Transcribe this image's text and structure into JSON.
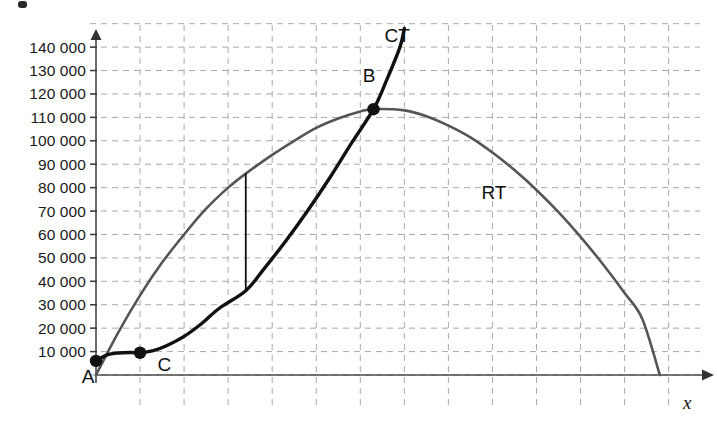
{
  "chart_data": {
    "type": "line",
    "title": "",
    "xlabel": "x",
    "ylabel": "",
    "grid": true,
    "legend_position": "inline-curve-labels",
    "xlim": [
      0,
      12.8
    ],
    "ylim": [
      0,
      150000
    ],
    "y_ticks": [
      {
        "value": 10000,
        "label": "10 000"
      },
      {
        "value": 20000,
        "label": "20 000"
      },
      {
        "value": 30000,
        "label": "30 000"
      },
      {
        "value": 40000,
        "label": "40 000"
      },
      {
        "value": 50000,
        "label": "50 000"
      },
      {
        "value": 60000,
        "label": "60 000"
      },
      {
        "value": 70000,
        "label": "70 000"
      },
      {
        "value": 80000,
        "label": "80 000"
      },
      {
        "value": 90000,
        "label": "90 000"
      },
      {
        "value": 100000,
        "label": "100 000"
      },
      {
        "value": 110000,
        "label": "110 000"
      },
      {
        "value": 120000,
        "label": "120 000"
      },
      {
        "value": 130000,
        "label": "130 000"
      },
      {
        "value": 140000,
        "label": "140 000"
      }
    ],
    "x_gridline_count": 13,
    "series": [
      {
        "name": "RT",
        "label": "RT",
        "label_position": {
          "x": 8.75,
          "y": 75000
        },
        "color": "#555558",
        "description": "Total revenue curve: concave-down parabola from origin, peaking near x=6.3 at about 114000 and returning to zero near x=12.8",
        "points": [
          {
            "x": 0.0,
            "y": 0
          },
          {
            "x": 0.5,
            "y": 18000
          },
          {
            "x": 1.0,
            "y": 34000
          },
          {
            "x": 1.5,
            "y": 48000
          },
          {
            "x": 2.0,
            "y": 60000
          },
          {
            "x": 2.5,
            "y": 71000
          },
          {
            "x": 3.0,
            "y": 80000
          },
          {
            "x": 3.4,
            "y": 86000
          },
          {
            "x": 4.0,
            "y": 94000
          },
          {
            "x": 4.5,
            "y": 100000
          },
          {
            "x": 5.0,
            "y": 105500
          },
          {
            "x": 5.5,
            "y": 109500
          },
          {
            "x": 6.0,
            "y": 112500
          },
          {
            "x": 6.3,
            "y": 113500
          },
          {
            "x": 7.0,
            "y": 113000
          },
          {
            "x": 7.5,
            "y": 110500
          },
          {
            "x": 8.0,
            "y": 106500
          },
          {
            "x": 8.5,
            "y": 101500
          },
          {
            "x": 9.0,
            "y": 95000
          },
          {
            "x": 9.5,
            "y": 87500
          },
          {
            "x": 10.0,
            "y": 79000
          },
          {
            "x": 10.5,
            "y": 69500
          },
          {
            "x": 11.0,
            "y": 59000
          },
          {
            "x": 11.5,
            "y": 47500
          },
          {
            "x": 12.0,
            "y": 35000
          },
          {
            "x": 12.4,
            "y": 24000
          },
          {
            "x": 12.8,
            "y": 0
          }
        ]
      },
      {
        "name": "CT",
        "label": "CT",
        "label_position": {
          "x": 6.55,
          "y": 142000
        },
        "color": "#111111",
        "description": "Total cost curve: cubic S-shape starting near 6000 at the origin, flattening near x=1 at about 9500, then rising steeply through B and leaving the top of the plot",
        "points": [
          {
            "x": 0.0,
            "y": 6000
          },
          {
            "x": 0.25,
            "y": 8600
          },
          {
            "x": 0.5,
            "y": 9400
          },
          {
            "x": 0.8,
            "y": 9600
          },
          {
            "x": 1.0,
            "y": 9500
          },
          {
            "x": 1.3,
            "y": 10400
          },
          {
            "x": 1.6,
            "y": 12500
          },
          {
            "x": 2.0,
            "y": 16500
          },
          {
            "x": 2.4,
            "y": 22000
          },
          {
            "x": 2.8,
            "y": 28500
          },
          {
            "x": 3.4,
            "y": 36000
          },
          {
            "x": 3.8,
            "y": 45000
          },
          {
            "x": 4.3,
            "y": 57000
          },
          {
            "x": 4.8,
            "y": 70000
          },
          {
            "x": 5.3,
            "y": 84000
          },
          {
            "x": 5.8,
            "y": 99000
          },
          {
            "x": 6.3,
            "y": 113500
          },
          {
            "x": 6.6,
            "y": 126000
          },
          {
            "x": 6.9,
            "y": 140000
          },
          {
            "x": 7.0,
            "y": 148000
          }
        ]
      }
    ],
    "annotations": [
      {
        "name": "point-a",
        "label": "A",
        "x": 0.0,
        "y": 6000,
        "label_offset": {
          "x": -0.18,
          "y": -9500
        },
        "marker": "filled-circle"
      },
      {
        "name": "point-c",
        "label": "C",
        "x": 1.0,
        "y": 9500,
        "label_offset": {
          "x": 0.55,
          "y": -8000
        },
        "marker": "filled-circle"
      },
      {
        "name": "point-b",
        "label": "B",
        "x": 6.3,
        "y": 113500,
        "label_offset": {
          "x": -0.1,
          "y": 11500
        },
        "marker": "filled-circle"
      }
    ],
    "segments": [
      {
        "name": "vertical-gap-segment",
        "description": "Vertical line at x = 3.4 connecting the CT curve up to the RT curve, showing the profit gap",
        "x": 3.4,
        "y_from": 36000,
        "y_to": 86000
      }
    ]
  }
}
